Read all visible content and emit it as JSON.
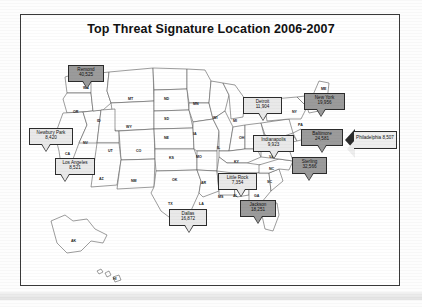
{
  "document": {
    "title": "Top Threat Signature Location 2006-2007",
    "frame_color": "#3a3a3a",
    "page_background": "#ffffff"
  },
  "map": {
    "name": "united-states-map",
    "region": "United States including Alaska and Hawaii",
    "outline_color": "#4a4a4a",
    "fill_color": "#ffffff"
  },
  "legend_colors": {
    "light_callout": "#e9e9e9",
    "dark_callout": "#9b9b9b",
    "callout_border": "#2c2c2c"
  },
  "chart_data": {
    "type": "map",
    "title": "Top Threat Signature Location 2006-2007",
    "xlabel": "",
    "ylabel": "",
    "value_label": "Threat signature count",
    "categories": [
      "Remond",
      "Newbury Park",
      "Los Angeles",
      "Dallas",
      "Little Rock",
      "Jackson",
      "Indianapolis",
      "Detroit",
      "New York",
      "Baltimore",
      "Sterling",
      "Philadelphia"
    ],
    "values": [
      40525,
      8420,
      8521,
      16872,
      7354,
      18251,
      9923,
      11904,
      19956,
      24581,
      32566,
      8507
    ],
    "legend_position": "none",
    "grid": false
  },
  "callouts": [
    {
      "id": "remond",
      "name": "Remond",
      "value": "40,525",
      "style": "dark",
      "x": 47,
      "y": 26,
      "w": 36,
      "h": 17,
      "tail_x": 15
    },
    {
      "id": "newbury-park",
      "name": "Newbury Park",
      "value": "8,420",
      "style": "light",
      "x": 8,
      "y": 89,
      "w": 44,
      "h": 17,
      "tail_x": 13
    },
    {
      "id": "los-angeles",
      "name": "Los Angeles",
      "value": "8,521",
      "style": "light",
      "x": 34,
      "y": 119,
      "w": 40,
      "h": 17,
      "tail_x": 6
    },
    {
      "id": "dallas",
      "name": "Dallas",
      "value": "16,872",
      "style": "light",
      "x": 148,
      "y": 170,
      "w": 38,
      "h": 17,
      "tail_x": 16
    },
    {
      "id": "little-rock",
      "name": "Little Rock",
      "value": "7,354",
      "style": "light",
      "x": 197,
      "y": 134,
      "w": 39,
      "h": 17,
      "tail_x": 19
    },
    {
      "id": "jackson",
      "name": "Jackson",
      "value": "18,251",
      "style": "dark",
      "x": 219,
      "y": 161,
      "w": 36,
      "h": 17,
      "tail_x": 14
    },
    {
      "id": "indianapolis",
      "name": "Indianapolis",
      "value": "9,923",
      "style": "light",
      "x": 232,
      "y": 96,
      "w": 41,
      "h": 17,
      "tail_x": 17
    },
    {
      "id": "detroit",
      "name": "Detroit",
      "value": "11,904",
      "style": "light",
      "x": 222,
      "y": 58,
      "w": 39,
      "h": 17,
      "tail_x": 16
    },
    {
      "id": "new-york",
      "name": "New York",
      "value": "19,956",
      "style": "dark",
      "x": 283,
      "y": 54,
      "w": 41,
      "h": 17,
      "tail_x": 13
    },
    {
      "id": "baltimore",
      "name": "Baltimore",
      "value": "24,581",
      "style": "dark",
      "x": 280,
      "y": 90,
      "w": 42,
      "h": 17,
      "tail_x": 17
    },
    {
      "id": "sterling",
      "name": "Sterling",
      "value": "32,566",
      "style": "dark",
      "x": 271,
      "y": 118,
      "w": 35,
      "h": 17,
      "tail_x": 13
    }
  ],
  "arrow_callout": {
    "id": "philadelphia",
    "name": "Philadelphia",
    "value": "8,507",
    "x": 324,
    "y": 92
  },
  "state_labels": [
    {
      "ab": "WA",
      "x": 62,
      "y": 47
    },
    {
      "ab": "OR",
      "x": 52,
      "y": 71
    },
    {
      "ab": "ID",
      "x": 76,
      "y": 80
    },
    {
      "ab": "MT",
      "x": 107,
      "y": 58
    },
    {
      "ab": "ND",
      "x": 143,
      "y": 58
    },
    {
      "ab": "MN",
      "x": 172,
      "y": 63
    },
    {
      "ab": "WI",
      "x": 192,
      "y": 77
    },
    {
      "ab": "SD",
      "x": 143,
      "y": 78
    },
    {
      "ab": "WY",
      "x": 105,
      "y": 86
    },
    {
      "ab": "NE",
      "x": 143,
      "y": 97
    },
    {
      "ab": "IA",
      "x": 172,
      "y": 93
    },
    {
      "ab": "IL",
      "x": 196,
      "y": 107
    },
    {
      "ab": "MI",
      "x": 212,
      "y": 80
    },
    {
      "ab": "OH",
      "x": 218,
      "y": 97
    },
    {
      "ab": "NV",
      "x": 62,
      "y": 102
    },
    {
      "ab": "UT",
      "x": 87,
      "y": 110
    },
    {
      "ab": "CA",
      "x": 44,
      "y": 113
    },
    {
      "ab": "CO",
      "x": 115,
      "y": 110
    },
    {
      "ab": "KS",
      "x": 148,
      "y": 117
    },
    {
      "ab": "MO",
      "x": 175,
      "y": 116
    },
    {
      "ab": "KY",
      "x": 213,
      "y": 121
    },
    {
      "ab": "AZ",
      "x": 78,
      "y": 138
    },
    {
      "ab": "NM",
      "x": 110,
      "y": 140
    },
    {
      "ab": "OK",
      "x": 151,
      "y": 139
    },
    {
      "ab": "AR",
      "x": 180,
      "y": 142
    },
    {
      "ab": "TN",
      "x": 207,
      "y": 134
    },
    {
      "ab": "TX",
      "x": 147,
      "y": 163
    },
    {
      "ab": "LA",
      "x": 178,
      "y": 163
    },
    {
      "ab": "MS",
      "x": 197,
      "y": 156
    },
    {
      "ab": "AL",
      "x": 212,
      "y": 155
    },
    {
      "ab": "GA",
      "x": 233,
      "y": 155
    },
    {
      "ab": "FL",
      "x": 245,
      "y": 173
    },
    {
      "ab": "SC",
      "x": 246,
      "y": 141
    },
    {
      "ab": "NC",
      "x": 248,
      "y": 128
    },
    {
      "ab": "VA",
      "x": 248,
      "y": 116
    },
    {
      "ab": "ME",
      "x": 300,
      "y": 48
    },
    {
      "ab": "NY",
      "x": 271,
      "y": 71
    },
    {
      "ab": "PA",
      "x": 277,
      "y": 84
    },
    {
      "ab": "WV",
      "x": 240,
      "y": 108
    },
    {
      "ab": "AK",
      "x": 50,
      "y": 200
    },
    {
      "ab": "HI",
      "x": 92,
      "y": 238
    }
  ]
}
